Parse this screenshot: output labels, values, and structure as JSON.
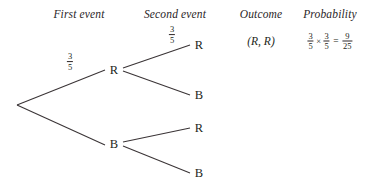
{
  "diagram": {
    "type": "probability-tree",
    "headers": {
      "first_event": "First event",
      "second_event": "Second event",
      "outcome": "Outcome",
      "probability": "Probability"
    },
    "nodes": {
      "level1": [
        {
          "id": "r1",
          "label": "R"
        },
        {
          "id": "b1",
          "label": "B"
        }
      ],
      "level2": [
        {
          "id": "r1r",
          "label": "R"
        },
        {
          "id": "r1b",
          "label": "B"
        },
        {
          "id": "b1r",
          "label": "R"
        },
        {
          "id": "b1b",
          "label": "B"
        }
      ]
    },
    "branch_probabilities": {
      "first_r": {
        "numerator": "3",
        "denominator": "5"
      },
      "second_r": {
        "numerator": "3",
        "denominator": "5"
      }
    },
    "outcomes": [
      {
        "label": "(R, R)"
      }
    ],
    "probability_expression": {
      "factor1": {
        "numerator": "3",
        "denominator": "5"
      },
      "times": "×",
      "factor2": {
        "numerator": "3",
        "denominator": "5"
      },
      "equals": "=",
      "result": {
        "numerator": "9",
        "denominator": "25"
      }
    },
    "colors": {
      "background": "#ffffff",
      "ink": "#231f20",
      "line": "#3a3436"
    }
  }
}
